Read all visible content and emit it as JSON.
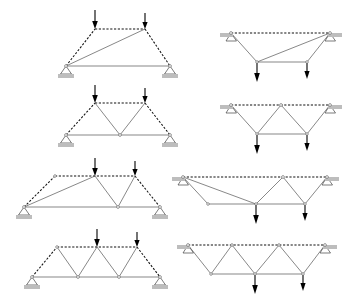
{
  "figure": {
    "background_color": "#ffffff",
    "width": 349,
    "height": 298,
    "member_styles": {
      "dashed_label": "dashed member",
      "dashed_color": "#111111",
      "solid_label": "solid member",
      "solid_color": "#555555"
    },
    "arrow_color": "#000000",
    "support_pad_color": "#bdbdbd",
    "columns": [
      "upright",
      "inverted"
    ],
    "rows": [
      "row-1",
      "row-2",
      "row-3",
      "row-4"
    ],
    "load_count_per_truss": 2,
    "support_count_per_truss": 2
  },
  "trusses": [
    {
      "id": "truss-1-left",
      "row": 1,
      "column": "upright",
      "orientation": "upright",
      "description": "Trapezoidal truss, single long diagonal from left support to right top node",
      "span_label": "short span",
      "load_direction": "down",
      "loads": 2,
      "supports": 2,
      "top_nodes": 2,
      "bottom_nodes": 2,
      "web_pattern": "single diagonal"
    },
    {
      "id": "truss-1-right",
      "row": 1,
      "column": "inverted",
      "orientation": "inverted",
      "description": "Inverted trapezoidal truss, supports on top chord, single long diagonal",
      "span_label": "short span",
      "load_direction": "down",
      "loads": 2,
      "supports": 2,
      "top_nodes": 2,
      "bottom_nodes": 2,
      "web_pattern": "single diagonal"
    },
    {
      "id": "truss-2-left",
      "row": 2,
      "column": "upright",
      "orientation": "upright",
      "description": "Trapezoidal truss with V-shaped web between the two top nodes",
      "span_label": "short span",
      "load_direction": "down",
      "loads": 2,
      "supports": 2,
      "top_nodes": 2,
      "bottom_nodes": 3,
      "web_pattern": "V web"
    },
    {
      "id": "truss-2-right",
      "row": 2,
      "column": "inverted",
      "orientation": "inverted",
      "description": "Inverted trapezoidal truss with inverted-V web, supports on top chord",
      "span_label": "short span",
      "load_direction": "down",
      "loads": 2,
      "supports": 2,
      "top_nodes": 3,
      "bottom_nodes": 2,
      "web_pattern": "inverted V web"
    },
    {
      "id": "truss-3-left",
      "row": 3,
      "column": "upright",
      "orientation": "upright",
      "description": "Wide trapezoidal truss, long diagonal to first loaded node plus V web",
      "span_label": "long span",
      "load_direction": "down",
      "loads": 2,
      "supports": 2,
      "top_nodes": 3,
      "bottom_nodes": 3,
      "web_pattern": "long diagonal plus V web"
    },
    {
      "id": "truss-3-right",
      "row": 3,
      "column": "inverted",
      "orientation": "inverted",
      "description": "Inverted wide trapezoidal truss, long diagonal plus inverted-V web",
      "span_label": "long span",
      "load_direction": "down",
      "loads": 2,
      "supports": 2,
      "top_nodes": 3,
      "bottom_nodes": 3,
      "web_pattern": "long diagonal plus inverted V web"
    },
    {
      "id": "truss-4-left",
      "row": 4,
      "column": "upright",
      "orientation": "upright",
      "description": "Warren truss with full triangulated web, three top nodes",
      "span_label": "long span",
      "load_direction": "down",
      "loads": 2,
      "supports": 2,
      "top_nodes": 3,
      "bottom_nodes": 2,
      "web_pattern": "Warren triangulation"
    },
    {
      "id": "truss-4-right",
      "row": 4,
      "column": "inverted",
      "orientation": "inverted",
      "description": "Inverted Warren truss with full triangulated web, supports on top chord",
      "span_label": "long span",
      "load_direction": "down",
      "loads": 2,
      "supports": 2,
      "top_nodes": 3,
      "bottom_nodes": 3,
      "web_pattern": "Warren triangulation"
    }
  ]
}
